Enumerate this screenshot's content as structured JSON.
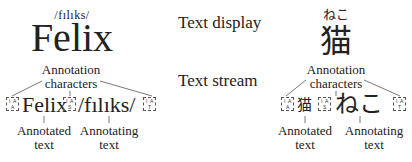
{
  "labels": {
    "text_display": "Text display",
    "text_stream": "Text stream"
  },
  "left_example": {
    "ruby": "/fılıks/",
    "base": "Felix",
    "annotation_characters_line1": "Annotation",
    "annotation_characters_line2": "characters",
    "stream": {
      "anchor_box": {
        "top_left": "I",
        "top_right": "A",
        "bottom": "A"
      },
      "annotated": "Felix",
      "separator_box": {
        "top_left": "I",
        "top_right": "A",
        "bottom": "S"
      },
      "annotating": "/fılıks/",
      "terminator_box": {
        "top_left": "I",
        "top_right": "A",
        "bottom": "T"
      }
    },
    "annotated_label_line1": "Annotated",
    "annotated_label_line2": "text",
    "annotating_label_line1": "Annotating",
    "annotating_label_line2": "text"
  },
  "right_example": {
    "ruby": "ねこ",
    "base": "猫",
    "annotation_characters_line1": "Annotation",
    "annotation_characters_line2": "characters",
    "stream": {
      "anchor_box": {
        "top_left": "I",
        "top_right": "A",
        "bottom": "A"
      },
      "annotated": "猫",
      "separator_box": {
        "top_left": "I",
        "top_right": "A",
        "bottom": "S"
      },
      "annotating": "ねこ",
      "terminator_box": {
        "top_left": "I",
        "top_right": "A",
        "bottom": "T"
      }
    },
    "annotated_label_line1": "Annotated",
    "annotated_label_line2": "text",
    "annotating_label_line1": "Annotating",
    "annotating_label_line2": "text"
  }
}
